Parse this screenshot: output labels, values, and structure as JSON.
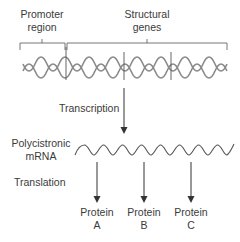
{
  "labels": {
    "promoter_line1": "Promoter",
    "promoter_line2": "region",
    "structural_line1": "Structural",
    "structural_line2": "genes",
    "transcription": "Transcription",
    "mrna_line1": "Polycistronic",
    "mrna_line2": "mRNA",
    "translation": "Translation"
  },
  "proteins": [
    {
      "line1": "Protein",
      "line2": "A"
    },
    {
      "line1": "Protein",
      "line2": "B"
    },
    {
      "line1": "Protein",
      "line2": "C"
    }
  ],
  "colors": {
    "stroke": "#555555",
    "helix": "#8a8a8a",
    "text": "#3a3a3a"
  }
}
